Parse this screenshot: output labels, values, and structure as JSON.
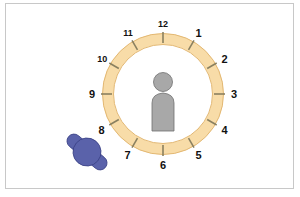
{
  "diagram": {
    "clock": {
      "ring_color": "#f8dca8",
      "ring_stroke": "#e3b873",
      "tick_color": "#8a8060",
      "hours": [
        "12",
        "1",
        "2",
        "3",
        "4",
        "5",
        "6",
        "7",
        "8",
        "9",
        "10",
        "11"
      ]
    },
    "center_person": {
      "label": "person",
      "color": "#a8a8a8",
      "outline": "#707070"
    },
    "observer": {
      "label": "observer (top view)",
      "color": "#5a62aa",
      "outline": "#3b4286"
    }
  }
}
